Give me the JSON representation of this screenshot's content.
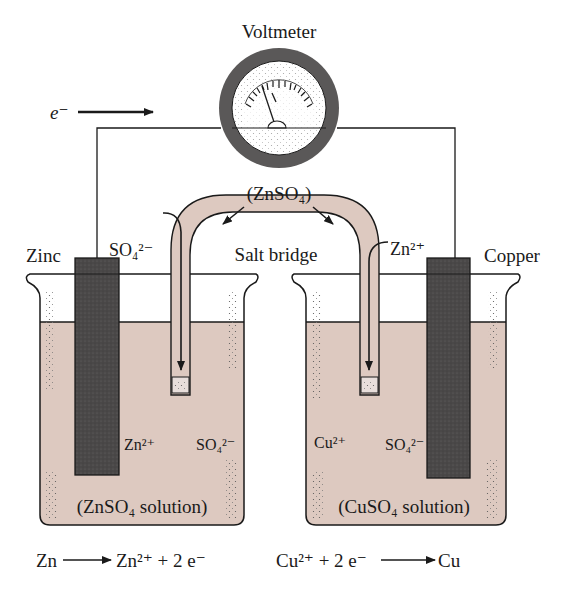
{
  "title": "Voltmeter",
  "electron_label": "e⁻",
  "salt_bridge": {
    "label": "Salt bridge",
    "electrolyte": "(ZnSO₄)",
    "left_ion_flow": "SO₄²⁻",
    "right_ion_flow": "Zn²⁺"
  },
  "anode": {
    "name": "Zinc",
    "solution": "(ZnSO₄ solution)",
    "cation": "Zn²⁺",
    "anion": "SO₄²⁻",
    "half_reaction": {
      "left": "Zn",
      "right": "Zn²⁺ + 2 e⁻"
    }
  },
  "cathode": {
    "name": "Copper",
    "solution": "(CuSO₄ solution)",
    "cation": "Cu²⁺",
    "anion": "SO₄²⁻",
    "half_reaction": {
      "left": "Cu²⁺ + 2 e⁻",
      "right": "Cu"
    }
  },
  "colors": {
    "solution": "#ddc9c0",
    "electrode": "#4a4848",
    "meter_ring": "#5a5858",
    "line": "#1a1a1a"
  }
}
